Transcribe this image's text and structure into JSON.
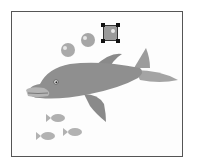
{
  "image": {
    "description": "Clip art: dolphin with bubbles and small fish",
    "selected_object": "small gray square bubble with selection handles"
  },
  "colors": {
    "frame": "#555555",
    "dolphin_body": "#8f8f8f",
    "dolphin_belly": "#b5b5b5",
    "bubble": "#a8a8a8",
    "fish": "#b0b0b0",
    "handle": "#111111"
  }
}
